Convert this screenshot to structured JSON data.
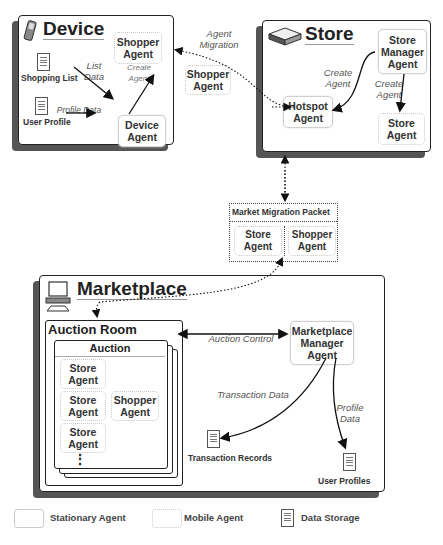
{
  "device": {
    "title": "Device",
    "icon": "phone-icon",
    "shopper_agent": "Shopper Agent",
    "device_agent": "Device Agent",
    "shopping_list": "Shopping List",
    "user_profile": "User Profile",
    "list_data_label": "List Data",
    "profile_data_label": "Profile Data",
    "create_agent_label": "Create Agent"
  },
  "migration": {
    "agent_migration_label": "Agent Migration",
    "floating_shopper_agent": "Shopper Agent"
  },
  "store": {
    "title": "Store",
    "icon": "store-box-icon",
    "store_manager_agent": "Store Manager Agent",
    "hotspot_agent": "Hotspot Agent",
    "store_agent": "Store Agent",
    "create_agent_label_left": "Create Agent",
    "create_agent_label_right": "Create Agent"
  },
  "packet": {
    "title": "Market Migration Packet",
    "store_agent": "Store Agent",
    "shopper_agent": "Shopper Agent"
  },
  "marketplace": {
    "title": "Marketplace",
    "icon": "computer-icon",
    "auction_room": "Auction Room",
    "auction": "Auction",
    "store_agent_1": "Store Agent",
    "store_agent_2": "Store Agent",
    "store_agent_3": "Store Agent",
    "shopper_agent": "Shopper Agent",
    "ellipsis": "⋮",
    "auction_control_label": "Auction Control",
    "manager_agent": "Marketplace Manager Agent",
    "transaction_data_label": "Transaction Data",
    "profile_data_label": "Profile Data",
    "transaction_records": "Transaction Records",
    "user_profiles": "User Profiles"
  },
  "legend": {
    "stationary": "Stationary Agent",
    "mobile": "Mobile Agent",
    "storage": "Data Storage"
  }
}
